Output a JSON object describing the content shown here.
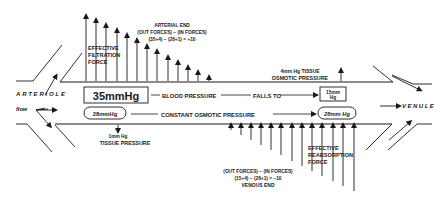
{
  "diagram": {
    "vessels": {
      "arteriole_label": "ARTERIOLE",
      "flow_label": "flow",
      "venule_label": "VENULE"
    },
    "arterial_end": {
      "heading": "ARTERIAL END",
      "formula_line1": "(OUT FORCES) − (IN FORCES)",
      "formula_line2": "(35+4) − (28+1) = +10",
      "force_label_1": "EFFECTIVE",
      "force_label_2": "FILTRATION",
      "force_label_3": "FORCE"
    },
    "venous_end": {
      "heading": "VENOUS END",
      "formula_line1": "(OUT FORCES) − (IN FORCES)",
      "formula_line2": "(15+4) − (28+1) = −10",
      "force_label_1": "EFFECTIVE",
      "force_label_2": "REABSORPTION",
      "force_label_3": "FORCE"
    },
    "tissue_osmotic": {
      "line1": "4mm Hg TISSUE",
      "line2": "OSMOTIC PRESSURE"
    },
    "blood_pressure": {
      "start_value": "35mmHg",
      "label": "BLOOD PRESSURE",
      "falls_to": "FALLS TO",
      "end_value_1": "15mm",
      "end_value_2": "Hg"
    },
    "osmotic_pressure": {
      "start_value": "28mmHg",
      "label": "CONSTANT OSMOTIC PRESSURE",
      "end_value": "28mm Hg"
    },
    "tissue_pressure": {
      "line1": "1mm Hg",
      "line2": "TISSUE PRESSURE"
    },
    "colors": {
      "ink": "#1a1a1a",
      "background": "#ffffff"
    }
  }
}
